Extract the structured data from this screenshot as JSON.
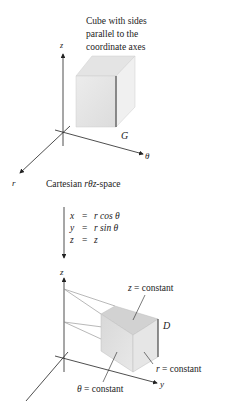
{
  "top_figure": {
    "caption": [
      "Cube with sides",
      "parallel to the",
      "coordinate axes"
    ],
    "region_label": "G",
    "axes": {
      "vertical": "z",
      "horizontal": "θ",
      "diagonal": "r"
    },
    "space_label_prefix": "Cartesian ",
    "space_label_var": "rθz",
    "space_label_suffix": "-space"
  },
  "transform": {
    "equations": [
      {
        "lhs": "x",
        "eq": "=",
        "rhs": "r cos θ"
      },
      {
        "lhs": "y",
        "eq": "=",
        "rhs": "r sin θ"
      },
      {
        "lhs": "z",
        "eq": "=",
        "rhs": "z"
      }
    ]
  },
  "bottom_figure": {
    "region_label": "D",
    "axes": {
      "vertical": "z",
      "horizontal": "y"
    },
    "annotations": {
      "z_const": "z  =  constant",
      "r_const": "r  =  constant",
      "theta_const": "θ  =  constant"
    }
  },
  "colors": {
    "ink": "#222222",
    "solid_front": "#e2e2e2",
    "solid_top": "#d4d4d4",
    "solid_side": "#ebebeb"
  }
}
